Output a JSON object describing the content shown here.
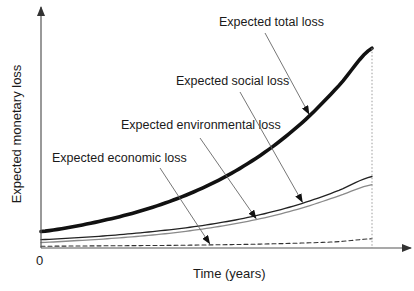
{
  "chart_data": {
    "type": "line",
    "title": "",
    "xlabel": "Time (years)",
    "ylabel": "Expected monetary loss",
    "x_tick_labels": [
      "0"
    ],
    "xlim": [
      0,
      1
    ],
    "ylim": [
      0,
      1
    ],
    "grid": false,
    "legend": "none",
    "x": [
      0,
      0.1,
      0.2,
      0.3,
      0.4,
      0.5,
      0.6,
      0.7,
      0.8,
      0.9,
      1.0
    ],
    "series": [
      {
        "name": "Expected total loss",
        "style": "thick-solid",
        "color": "#111111",
        "values": [
          0.075,
          0.098,
          0.129,
          0.168,
          0.218,
          0.281,
          0.361,
          0.461,
          0.585,
          0.738,
          0.908
        ]
      },
      {
        "name": "Expected social loss",
        "style": "thin-solid",
        "color": "#222222",
        "values": [
          0.038,
          0.046,
          0.056,
          0.069,
          0.085,
          0.105,
          0.131,
          0.165,
          0.208,
          0.262,
          0.325
        ]
      },
      {
        "name": "Expected environmental loss",
        "style": "thin-solid",
        "color": "#8a8a8a",
        "values": [
          0.025,
          0.033,
          0.042,
          0.054,
          0.069,
          0.089,
          0.114,
          0.146,
          0.187,
          0.237,
          0.288
        ]
      },
      {
        "name": "Expected economic loss",
        "style": "dashed",
        "color": "#333333",
        "values": [
          0.008,
          0.009,
          0.01,
          0.011,
          0.012,
          0.014,
          0.016,
          0.019,
          0.023,
          0.029,
          0.042
        ]
      }
    ],
    "annotations": [
      {
        "text": "Expected total loss",
        "target_series": 0,
        "target_x": 0.81
      },
      {
        "text": "Expected social loss",
        "target_series": 1,
        "target_x": 0.79
      },
      {
        "text": "Expected environmental loss",
        "target_series": 2,
        "target_x": 0.65
      },
      {
        "text": "Expected economic loss",
        "target_series": 3,
        "target_x": 0.51
      }
    ],
    "vertical_marker": {
      "x": 1.0,
      "style": "dotted"
    }
  }
}
